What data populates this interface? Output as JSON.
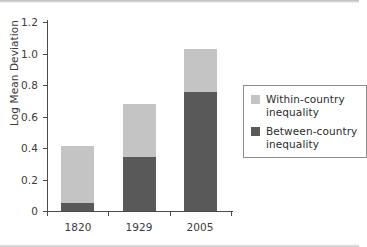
{
  "chart_data": {
    "type": "bar",
    "subtype": "stacked-bar",
    "title": "",
    "xlabel": "",
    "ylabel": "Log Mean Deviation",
    "categories": [
      "1820",
      "1929",
      "2005"
    ],
    "ylim": [
      0,
      1.2
    ],
    "yticks": [
      "0",
      "0.2",
      "0.4",
      "0.6",
      "0.8",
      "1.0",
      "1.2"
    ],
    "ytick_values": [
      0,
      0.2,
      0.4,
      0.6,
      0.8,
      1.0,
      1.2
    ],
    "grid": false,
    "legend_position": "right",
    "series": [
      {
        "name": "Between-country inequality",
        "color": "#595959",
        "values": [
          0.05,
          0.34,
          0.755
        ]
      },
      {
        "name": "Within-country inequality",
        "color": "#c4c4c4",
        "values": [
          0.36,
          0.34,
          0.275
        ]
      }
    ],
    "totals": [
      0.41,
      0.68,
      1.03
    ],
    "stack_order": [
      "Between-country inequality",
      "Within-country inequality"
    ]
  },
  "legend": {
    "items": [
      {
        "label_line1": "Within-country",
        "label_line2": "inequality",
        "color": "#c4c4c4"
      },
      {
        "label_line1": "Between-country",
        "label_line2": "inequality",
        "color": "#595959"
      }
    ]
  },
  "axes": {
    "y_axis_label": "Log Mean Deviation",
    "y_tick_labels": [
      "1.2",
      "1.0",
      "0.8",
      "0.6",
      "0.4",
      "0.2",
      "0"
    ],
    "x_tick_labels": [
      "1820",
      "1929",
      "2005"
    ]
  },
  "colors": {
    "within": "#c4c4c4",
    "between": "#595959",
    "axis": "#4a4a4a",
    "text": "#3b3b3b",
    "legend_border": "#8e8e8e",
    "background": "#ffffff"
  }
}
